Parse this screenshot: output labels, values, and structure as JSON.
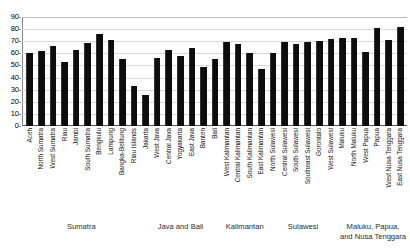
{
  "chart_data": {
    "type": "bar",
    "title": "",
    "subtitle": "",
    "xlabel": "",
    "ylabel": "",
    "ylim": [
      0,
      90
    ],
    "ytick_step": 10,
    "yticks": [
      0,
      10,
      20,
      30,
      40,
      50,
      60,
      70,
      80,
      90
    ],
    "grid": true,
    "legend": "none",
    "bar_color": "#0d0d0d",
    "categories": [
      "Aceh",
      "North Sumatra",
      "West Sumatra",
      "Riau",
      "Jambi",
      "South Sumatra",
      "Bengkulu",
      "Lampung",
      "Bangka-Belitung",
      "Riau Islands",
      "Jakarta",
      "West Java",
      "Central Java",
      "Yogyakarta",
      "East Java",
      "Banten",
      "Bali",
      "West Kalimantan",
      "Central Kalimantan",
      "South Kalimantan",
      "East Kalimantan",
      "North Sulawesi",
      "Central Sulawesi",
      "South Sulawesi",
      "Southeast Sulawesi",
      "Gorontalo",
      "West Sulawesi",
      "Maluku",
      "North Maluku",
      "West Papua",
      "Papua",
      "West Nusa Tenggara",
      "East Nusa Tenggara"
    ],
    "values": [
      60.5,
      62.0,
      66.0,
      52.5,
      63.0,
      68.5,
      76.0,
      71.0,
      55.5,
      33.0,
      26.0,
      56.5,
      63.0,
      57.5,
      64.5,
      48.5,
      55.5,
      69.0,
      67.5,
      60.5,
      47.0,
      60.5,
      69.5,
      67.5,
      69.5,
      70.0,
      71.5,
      72.5,
      73.0,
      61.0,
      81.0,
      71.0,
      82.0
    ],
    "groups": [
      {
        "label": "Sumatra",
        "start": 0,
        "end": 9
      },
      {
        "label": "Java and Bali",
        "start": 10,
        "end": 16
      },
      {
        "label": "Kalimantan",
        "start": 17,
        "end": 20
      },
      {
        "label": "Sulawesi",
        "start": 21,
        "end": 26
      },
      {
        "label": "Maluku, Papua,\nand Nusa Tenggara",
        "start": 27,
        "end": 32
      }
    ]
  }
}
